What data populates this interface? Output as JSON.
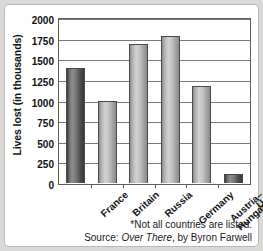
{
  "chart_data": {
    "type": "bar",
    "title": "",
    "xlabel": "",
    "ylabel": "Lives lost (in thousands)",
    "categories": [
      "France",
      "Britain",
      "Russia",
      "Germany",
      "Austria-Hungary",
      "U.S."
    ],
    "values": [
      1390,
      1000,
      1690,
      1780,
      1180,
      110
    ],
    "ylim": [
      0,
      2000
    ],
    "yticks": [
      2000,
      1750,
      1500,
      1250,
      1000,
      750,
      500,
      250,
      0
    ],
    "ytick_labels": [
      "2000",
      "1750",
      "1500",
      "1250",
      "1000",
      "750",
      "500",
      "250",
      "0"
    ],
    "grid": "horizontal",
    "legend": "none",
    "bar_styles": [
      "dark",
      "light",
      "light",
      "light",
      "light",
      "dark"
    ],
    "annotations": [
      "*Not all countries are listed.",
      "Source: Over There, by Byron Farwell"
    ]
  },
  "axis": {
    "y_title": "Lives lost (in thousands)"
  },
  "x_labels": [
    {
      "line1": "France",
      "line2": ""
    },
    {
      "line1": "Britain",
      "line2": ""
    },
    {
      "line1": "Russia",
      "line2": ""
    },
    {
      "line1": "Germany",
      "line2": ""
    },
    {
      "line1": "Austria–",
      "line2": "Hungary"
    },
    {
      "line1": "U.S.",
      "line2": ""
    }
  ],
  "notes": {
    "footnote": "*Not all countries are listed.",
    "source_prefix": "Source: ",
    "source_title": "Over There",
    "source_suffix": ", by Byron Farwell"
  },
  "colors": {
    "bar_dark": "#5a5a5a",
    "bar_light": "#bdbdbd",
    "axis": "#5d5d5d",
    "grid": "#7a7a7a",
    "background": "#ffffff",
    "page": "#d9d9d7"
  }
}
